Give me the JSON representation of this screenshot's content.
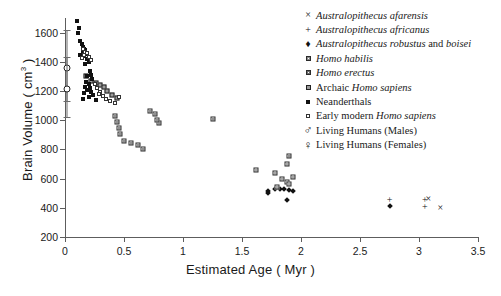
{
  "chart_data": {
    "type": "scatter",
    "title": "",
    "xlabel": "Estimated Age ( Myr )",
    "ylabel": "Brain Volume ( cm3 )",
    "xlim": [
      0,
      3.5
    ],
    "ylim": [
      200,
      1700
    ],
    "xticks": [
      "0",
      "0.5",
      "1",
      "1.5",
      "2",
      "2.5",
      "3",
      "3.5"
    ],
    "xtick_values": [
      0,
      0.5,
      1,
      1.5,
      2,
      2.5,
      3,
      3.5
    ],
    "yticks": [
      "200",
      "400",
      "600",
      "800",
      "1000",
      "1200",
      "1400",
      "1600"
    ],
    "ytick_values": [
      200,
      400,
      600,
      800,
      1000,
      1200,
      1400,
      1600
    ],
    "grid": false,
    "legend_position": "top-right",
    "series": [
      {
        "name": "Australopithecus afarensis",
        "marker": "cross-x",
        "italic": true,
        "points": [
          [
            3.08,
            458
          ],
          [
            3.18,
            400
          ]
        ]
      },
      {
        "name": "Australopithecus africanus",
        "marker": "plus",
        "italic": true,
        "points": [
          [
            2.75,
            455
          ],
          [
            3.05,
            455
          ],
          [
            3.05,
            405
          ]
        ]
      },
      {
        "name": "Australopithecus robustus and boisei",
        "marker": "diamond",
        "italic_prefix": "Australopithecus robustus",
        "italic_suffix": "boisei",
        "points": [
          [
            1.72,
            515
          ],
          [
            1.78,
            530
          ],
          [
            1.82,
            530
          ],
          [
            1.86,
            528
          ],
          [
            1.9,
            520
          ],
          [
            1.93,
            512
          ],
          [
            1.72,
            500
          ],
          [
            2.75,
            415
          ],
          [
            1.88,
            455
          ]
        ]
      },
      {
        "name": "Homo habilis",
        "marker": "square-light",
        "italic": true,
        "points": [
          [
            1.88,
            700
          ],
          [
            1.62,
            660
          ],
          [
            1.78,
            635
          ],
          [
            1.93,
            612
          ],
          [
            1.84,
            600
          ],
          [
            1.88,
            575
          ],
          [
            1.9,
            560
          ],
          [
            1.8,
            545
          ]
        ]
      },
      {
        "name": "Homo erectus",
        "marker": "square-mid",
        "italic": true,
        "points": [
          [
            0.42,
            1030
          ],
          [
            0.44,
            990
          ],
          [
            0.46,
            950
          ],
          [
            0.47,
            905
          ],
          [
            0.5,
            860
          ],
          [
            0.56,
            845
          ],
          [
            0.62,
            830
          ],
          [
            0.66,
            800
          ],
          [
            0.8,
            980
          ],
          [
            1.25,
            1010
          ],
          [
            1.9,
            755
          ],
          [
            0.72,
            1060
          ],
          [
            0.76,
            1040
          ],
          [
            0.78,
            1000
          ]
        ]
      },
      {
        "name": "Archaic Homo sapiens",
        "marker": "square-dark",
        "italic_suffix": "Homo sapiens",
        "points": [
          [
            0.3,
            1240
          ],
          [
            0.33,
            1225
          ],
          [
            0.36,
            1200
          ],
          [
            0.4,
            1175
          ],
          [
            0.44,
            1150
          ],
          [
            0.22,
            1270
          ],
          [
            0.26,
            1255
          ],
          [
            0.18,
            1300
          ]
        ]
      },
      {
        "name": "Neanderthals",
        "marker": "square-filled",
        "points": [
          [
            0.1,
            1680
          ],
          [
            0.12,
            1630
          ],
          [
            0.13,
            1545
          ],
          [
            0.14,
            1520
          ],
          [
            0.15,
            1500
          ],
          [
            0.16,
            1490
          ],
          [
            0.17,
            1480
          ],
          [
            0.15,
            1465
          ],
          [
            0.18,
            1455
          ],
          [
            0.13,
            1450
          ],
          [
            0.16,
            1440
          ],
          [
            0.14,
            1430
          ],
          [
            0.19,
            1420
          ],
          [
            0.2,
            1400
          ],
          [
            0.17,
            1385
          ],
          [
            0.21,
            1340
          ],
          [
            0.22,
            1310
          ],
          [
            0.19,
            1300
          ],
          [
            0.23,
            1285
          ],
          [
            0.18,
            1260
          ],
          [
            0.2,
            1245
          ],
          [
            0.17,
            1230
          ],
          [
            0.21,
            1220
          ],
          [
            0.19,
            1205
          ],
          [
            0.22,
            1195
          ],
          [
            0.16,
            1185
          ],
          [
            0.24,
            1175
          ],
          [
            0.2,
            1160
          ],
          [
            0.15,
            1145
          ],
          [
            0.26,
            1135
          ],
          [
            0.11,
            1595
          ]
        ]
      },
      {
        "name": "Early modern Homo sapiens",
        "marker": "square-open",
        "italic_suffix": "Homo sapiens",
        "points": [
          [
            0.15,
            1490
          ],
          [
            0.17,
            1470
          ],
          [
            0.19,
            1460
          ],
          [
            0.16,
            1445
          ],
          [
            0.2,
            1435
          ],
          [
            0.14,
            1425
          ],
          [
            0.22,
            1410
          ],
          [
            0.25,
            1250
          ],
          [
            0.27,
            1220
          ],
          [
            0.3,
            1195
          ],
          [
            0.32,
            1165
          ],
          [
            0.35,
            1145
          ],
          [
            0.38,
            1130
          ],
          [
            0.42,
            1120
          ],
          [
            0.29,
            1180
          ],
          [
            0.46,
            1160
          ]
        ]
      },
      {
        "name": "Living Humans (Males)",
        "marker": "mars-circle",
        "mean": 1360,
        "error_low": 1130,
        "error_high": 1620,
        "points": [
          [
            0.02,
            1360
          ]
        ]
      },
      {
        "name": "Living Humans (Females)",
        "marker": "venus-circle",
        "mean": 1215,
        "error_low": 1020,
        "error_high": 1430,
        "points": [
          [
            0.02,
            1215
          ]
        ]
      }
    ]
  },
  "legend": {
    "items": [
      {
        "symbol": "×",
        "label": "Australopithecus afarensis",
        "name": "legend-afarensis"
      },
      {
        "symbol": "+",
        "label": "Australopithecus africanus",
        "name": "legend-africanus"
      },
      {
        "symbol": "♦",
        "label": "Australopithecus robustus and boisei",
        "name": "legend-robustus-boisei"
      },
      {
        "symbol": "",
        "label": "Homo habilis",
        "name": "legend-habilis"
      },
      {
        "symbol": "",
        "label": "Homo erectus",
        "name": "legend-erectus"
      },
      {
        "symbol": "",
        "label": "Archaic Homo sapiens",
        "name": "legend-archaic-sapiens"
      },
      {
        "symbol": "",
        "label": "Neanderthals",
        "name": "legend-neanderthals"
      },
      {
        "symbol": "",
        "label": "Early modern Homo sapiens",
        "name": "legend-early-modern-sapiens"
      },
      {
        "symbol": "♂",
        "label": "Living Humans (Males)",
        "name": "legend-living-males"
      },
      {
        "symbol": "♀",
        "label": "Living Humans (Females)",
        "name": "legend-living-females"
      }
    ]
  }
}
